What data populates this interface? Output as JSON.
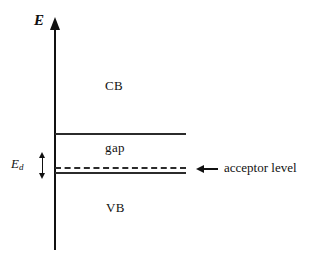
{
  "figure": {
    "type": "semiconductor-band-diagram",
    "background_color": "#ffffff",
    "line_color": "#2b2b2b"
  },
  "axis": {
    "label": "E",
    "arrow_icon": "up-arrow-icon"
  },
  "bands": {
    "conduction_label": "CB",
    "gap_label": "gap",
    "valence_label": "VB"
  },
  "energy_marker": {
    "symbol": "E",
    "subscript": "d",
    "arrow_icon": "double-headed-vertical-arrow-icon"
  },
  "callout": {
    "arrow_icon": "left-arrow-icon",
    "label": "acceptor level"
  },
  "chart_data": {
    "type": "diagram",
    "title": "",
    "xlabel": "",
    "ylabel": "E",
    "levels": [
      {
        "name": "CB",
        "role": "conduction band region",
        "label": "CB"
      },
      {
        "name": "CB-edge",
        "role": "conduction band bottom edge",
        "style": "solid"
      },
      {
        "name": "gap",
        "role": "band gap region",
        "label": "gap"
      },
      {
        "name": "acceptor",
        "role": "acceptor impurity level",
        "style": "dashed",
        "label": "acceptor level"
      },
      {
        "name": "VB-edge",
        "role": "valence band top edge",
        "style": "solid"
      },
      {
        "name": "VB",
        "role": "valence band region",
        "label": "VB"
      }
    ],
    "annotations": [
      {
        "text": "E_d",
        "meaning": "energy separation between acceptor level and valence band edge"
      },
      {
        "text": "acceptor level",
        "meaning": "callout pointing at the dashed level"
      }
    ]
  }
}
